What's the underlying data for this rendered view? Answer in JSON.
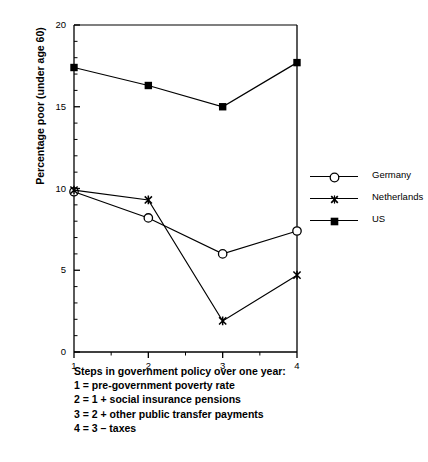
{
  "chart_data": {
    "type": "line",
    "title": "",
    "xlabel": "",
    "ylabel": "Percentage poor (under age 60)",
    "x": [
      1,
      2,
      3,
      4
    ],
    "categories": [
      "1",
      "2",
      "3",
      "4"
    ],
    "xlim": [
      1,
      4
    ],
    "ylim": [
      0,
      20
    ],
    "ytick_labels": [
      "0",
      "5",
      "10",
      "15",
      "20"
    ],
    "yticks": [
      0,
      5,
      10,
      15,
      20
    ],
    "xtick_labels": [
      "1",
      "2",
      "3",
      "4"
    ],
    "xticks": [
      1,
      2,
      3,
      4
    ],
    "y_minor_tick_step": 1,
    "x_minor_tick_step": 0.5,
    "grid": false,
    "legend_position": "right",
    "series": [
      {
        "name": "Germany",
        "marker": "open-circle",
        "color": "#000000",
        "values": [
          9.8,
          8.2,
          6.0,
          7.4
        ]
      },
      {
        "name": "Netherlands",
        "marker": "cross",
        "color": "#000000",
        "values": [
          9.9,
          9.3,
          1.9,
          4.7
        ]
      },
      {
        "name": "US",
        "marker": "filled-square",
        "color": "#000000",
        "values": [
          17.4,
          16.3,
          15.0,
          17.7
        ]
      }
    ]
  },
  "legend": {
    "items": [
      {
        "label": "Germany",
        "marker": "open-circle"
      },
      {
        "label": "Netherlands",
        "marker": "cross"
      },
      {
        "label": "US",
        "marker": "filled-square"
      }
    ]
  },
  "caption": {
    "lines": [
      "Steps in government policy over one year:",
      "1 = pre-government poverty rate",
      "2 = 1 + social insurance pensions",
      "3 = 2 + other public transfer payments",
      "4 = 3 – taxes"
    ]
  }
}
